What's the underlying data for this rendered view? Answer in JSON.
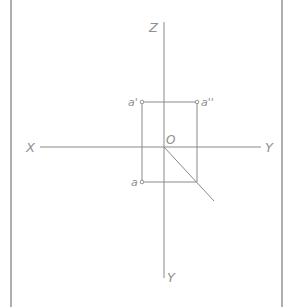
{
  "diagram": {
    "type": "orthographic projection of a point (three-view)",
    "axes": {
      "z_label": "Z",
      "x_label": "X",
      "y_right_label": "Y",
      "y_bottom_label": "Y",
      "origin_label": "O"
    },
    "points": {
      "front_view": "a'",
      "side_view": "a''",
      "top_view": "a"
    },
    "colors": {
      "line": "#8a8a8a",
      "text": "#909090",
      "border": "#9a9a9a",
      "background": "#ffffff"
    }
  }
}
